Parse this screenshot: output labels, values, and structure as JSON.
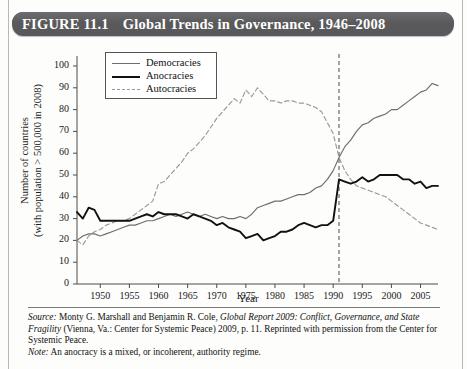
{
  "figure": {
    "number": "FIGURE 11.1",
    "title": "Global Trends in Governance, 1946–2008"
  },
  "legend": {
    "items": [
      {
        "key": "democracies",
        "label": "Democracies",
        "color": "#6e6e6e",
        "style": "solid"
      },
      {
        "key": "anocracies",
        "label": "Anocracies",
        "color": "#111111",
        "style": "solid-bold"
      },
      {
        "key": "autocracies",
        "label": "Autocracies",
        "color": "#9a9a9a",
        "style": "dashed"
      }
    ]
  },
  "annotations": {
    "vertical_marker_year": 1991,
    "vertical_marker_style": "dashed",
    "vertical_marker_color": "#8c8c8c"
  },
  "footer": {
    "source_label": "Source:",
    "source_text_1": " Monty G. Marshall and Benjamin R. Cole, ",
    "source_italic_1": "Global Report 2009: Conflict, Governance, and State Fragility",
    "source_text_2": " (Vienna, Va.: Center for Systemic Peace) 2009, p. 11. Reprinted with permission from the Center for Systemic Peace.",
    "note_label": "Note:",
    "note_text": " An anocracy is a mixed, or incoherent, authority regime."
  },
  "chart_data": {
    "type": "line",
    "title": "Global Trends in Governance, 1946–2008",
    "xlabel": "Year",
    "ylabel": "Number of countries (with population > 500,000 in 2008)",
    "ylabel_line1": "Number of countries",
    "ylabel_line2": "(with population > 500,000 in 2008)",
    "xlim": [
      1946,
      2008
    ],
    "ylim": [
      0,
      100
    ],
    "yticks": [
      0,
      10,
      20,
      30,
      40,
      50,
      60,
      70,
      80,
      90,
      100
    ],
    "xticks": [
      1950,
      1955,
      1960,
      1965,
      1970,
      1975,
      1980,
      1985,
      1990,
      1995,
      2000,
      2005
    ],
    "grid": false,
    "legend_position": "top-left-inside",
    "x": [
      1946,
      1947,
      1948,
      1949,
      1950,
      1951,
      1952,
      1953,
      1954,
      1955,
      1956,
      1957,
      1958,
      1959,
      1960,
      1961,
      1962,
      1963,
      1964,
      1965,
      1966,
      1967,
      1968,
      1969,
      1970,
      1971,
      1972,
      1973,
      1974,
      1975,
      1976,
      1977,
      1978,
      1979,
      1980,
      1981,
      1982,
      1983,
      1984,
      1985,
      1986,
      1987,
      1988,
      1989,
      1990,
      1991,
      1992,
      1993,
      1994,
      1995,
      1996,
      1997,
      1998,
      1999,
      2000,
      2001,
      2002,
      2003,
      2004,
      2005,
      2006,
      2007,
      2008
    ],
    "series": [
      {
        "name": "Democracies",
        "color": "#6e6e6e",
        "style": "solid",
        "values": [
          20,
          22,
          23,
          23,
          22,
          23,
          24,
          25,
          26,
          27,
          27,
          28,
          29,
          29,
          30,
          31,
          32,
          31,
          32,
          33,
          32,
          31,
          32,
          31,
          30,
          31,
          30,
          30,
          31,
          30,
          32,
          35,
          36,
          37,
          38,
          38,
          39,
          40,
          41,
          41,
          42,
          44,
          45,
          48,
          52,
          58,
          63,
          66,
          70,
          73,
          74,
          76,
          77,
          78,
          80,
          80,
          82,
          84,
          86,
          88,
          89,
          92,
          91
        ]
      },
      {
        "name": "Anocracies",
        "color": "#111111",
        "style": "solid-bold",
        "values": [
          33,
          30,
          35,
          34,
          29,
          29,
          29,
          29,
          29,
          29,
          30,
          31,
          32,
          31,
          33,
          32,
          32,
          32,
          31,
          30,
          32,
          31,
          30,
          29,
          27,
          28,
          26,
          25,
          24,
          21,
          22,
          23,
          20,
          21,
          22,
          24,
          24,
          25,
          27,
          28,
          27,
          26,
          27,
          27,
          29,
          48,
          47,
          46,
          47,
          49,
          47,
          48,
          50,
          50,
          50,
          50,
          48,
          48,
          46,
          47,
          44,
          45,
          45
        ]
      },
      {
        "name": "Autocracies",
        "color": "#9a9a9a",
        "style": "dashed",
        "values": [
          20,
          18,
          22,
          24,
          25,
          27,
          28,
          29,
          29,
          30,
          32,
          34,
          36,
          38,
          46,
          47,
          50,
          53,
          56,
          60,
          62,
          65,
          68,
          72,
          76,
          79,
          82,
          85,
          83,
          89,
          86,
          90,
          87,
          84,
          84,
          83,
          84,
          84,
          83,
          83,
          82,
          81,
          79,
          74,
          69,
          58,
          52,
          48,
          45,
          44,
          43,
          42,
          41,
          40,
          38,
          36,
          34,
          32,
          30,
          28,
          27,
          26,
          25
        ]
      }
    ]
  }
}
